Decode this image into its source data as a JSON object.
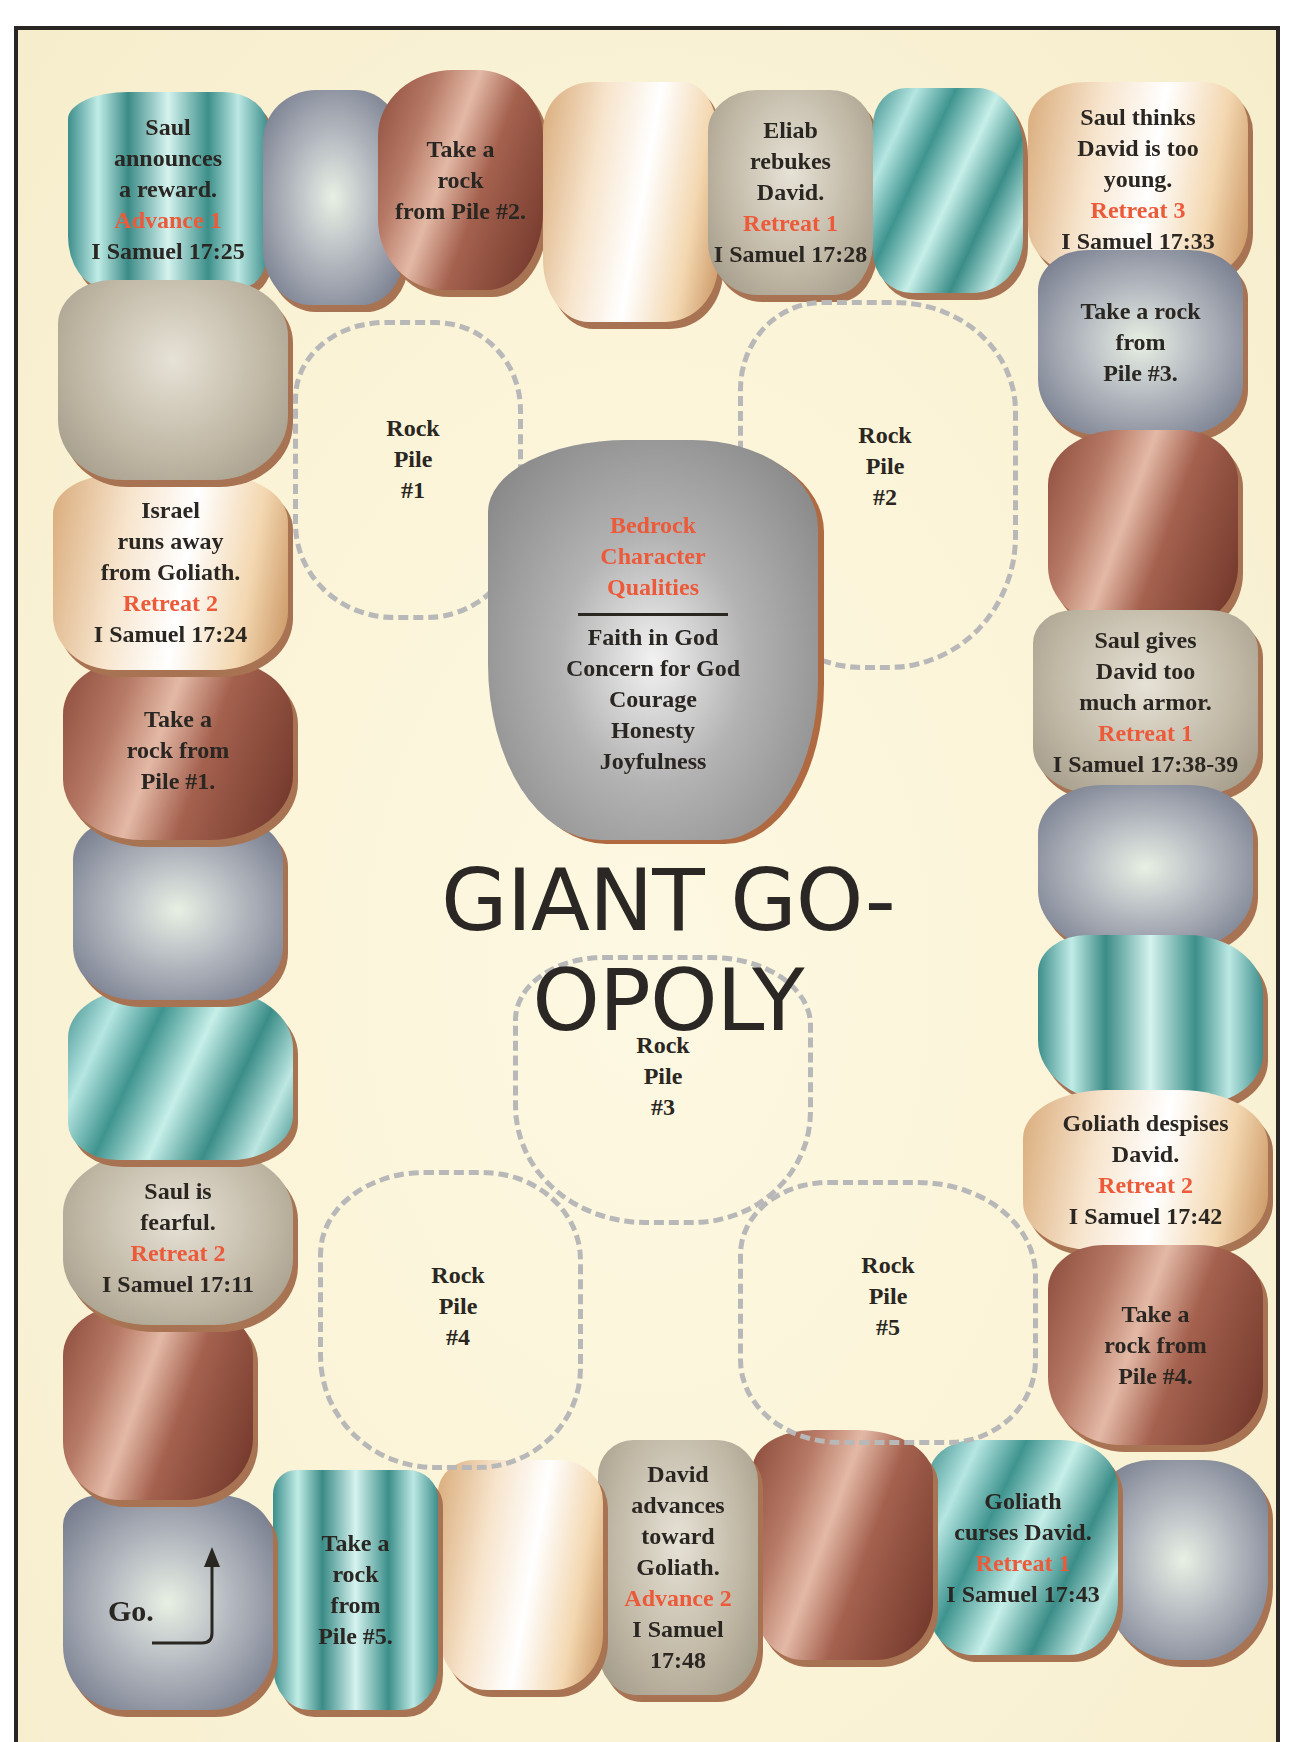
{
  "title": "GIANT GO-OPOLY",
  "colors": {
    "action_text": "#ec5a3a",
    "body_text": "#2a2622",
    "board_background": "#fbf4d8",
    "border": "#2a2624",
    "stone_shadow": "#a87352",
    "dashed_outline": "#b8b8b8"
  },
  "center": {
    "heading": [
      "Bedrock",
      "Character",
      "Qualities"
    ],
    "qualities": [
      "Faith in God",
      "Concern for God",
      "Courage",
      "Honesty",
      "Joyfulness"
    ]
  },
  "rock_piles": [
    {
      "lines": [
        "Rock",
        "Pile",
        "#1"
      ]
    },
    {
      "lines": [
        "Rock",
        "Pile",
        "#2"
      ]
    },
    {
      "lines": [
        "Rock",
        "Pile",
        "#3"
      ]
    },
    {
      "lines": [
        "Rock",
        "Pile",
        "#4"
      ]
    },
    {
      "lines": [
        "Rock",
        "Pile",
        "#5"
      ]
    }
  ],
  "spaces": {
    "go": {
      "label": "Go."
    },
    "take5": {
      "lines": [
        "Take a",
        "rock",
        "from",
        "Pile #5."
      ]
    },
    "david_advances": {
      "lines": [
        "David",
        "advances",
        "toward",
        "Goliath."
      ],
      "action": "Advance 2",
      "ref": [
        "I Samuel",
        "17:48"
      ]
    },
    "goliath_curses": {
      "lines": [
        "Goliath",
        "curses David."
      ],
      "action": "Retreat 1",
      "ref": "I Samuel 17:43"
    },
    "take4": {
      "lines": [
        "Take a",
        "rock from",
        "Pile #4."
      ]
    },
    "goliath_despises": {
      "lines": [
        "Goliath despises",
        "David."
      ],
      "action": "Retreat 2",
      "ref": "I Samuel 17:42"
    },
    "saul_armor": {
      "lines": [
        "Saul gives",
        "David too",
        "much armor."
      ],
      "action": "Retreat 1",
      "ref": "I Samuel 17:38-39"
    },
    "take3": {
      "lines": [
        "Take a rock",
        "from",
        "Pile #3."
      ]
    },
    "saul_young": {
      "lines": [
        "Saul thinks",
        "David is too",
        "young."
      ],
      "action": "Retreat 3",
      "ref": "I Samuel 17:33"
    },
    "eliab": {
      "lines": [
        "Eliab",
        "rebukes",
        "David."
      ],
      "action": "Retreat 1",
      "ref": "I Samuel 17:28"
    },
    "take2": {
      "lines": [
        "Take a",
        "rock",
        "from Pile #2."
      ]
    },
    "saul_reward": {
      "lines": [
        "Saul",
        "announces",
        "a reward."
      ],
      "action": "Advance 1",
      "ref": "I Samuel 17:25"
    },
    "israel_runs": {
      "lines": [
        "Israel",
        "runs away",
        "from Goliath."
      ],
      "action": "Retreat 2",
      "ref": "I Samuel 17:24"
    },
    "take1": {
      "lines": [
        "Take a",
        "rock from",
        "Pile #1."
      ]
    },
    "saul_fearful": {
      "lines": [
        "Saul is",
        "fearful."
      ],
      "action": "Retreat 2",
      "ref": "I Samuel 17:11"
    }
  }
}
